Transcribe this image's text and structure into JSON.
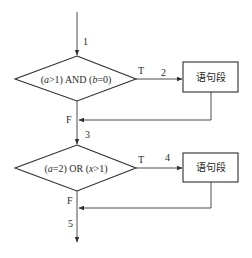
{
  "diagram": {
    "type": "flowchart",
    "edge_labels": {
      "entry": "1",
      "cond1_true": "2",
      "between": "3",
      "cond2_true": "4",
      "exit": "5"
    },
    "decisions": [
      {
        "id": "cond1",
        "text_parts": [
          "(",
          "a",
          ">1) AND (",
          "b",
          "=0)"
        ],
        "true_label": "T",
        "false_label": "F"
      },
      {
        "id": "cond2",
        "text_parts": [
          "(",
          "a",
          "=2) OR (",
          "x",
          ">1)"
        ],
        "true_label": "T",
        "false_label": "F"
      }
    ],
    "processes": [
      {
        "id": "stmt1",
        "text": "语句段"
      },
      {
        "id": "stmt2",
        "text": "语句段"
      }
    ],
    "colors": {
      "line": "#3a3a3a",
      "background": "#ffffff",
      "text": "#2a2a2a"
    }
  }
}
